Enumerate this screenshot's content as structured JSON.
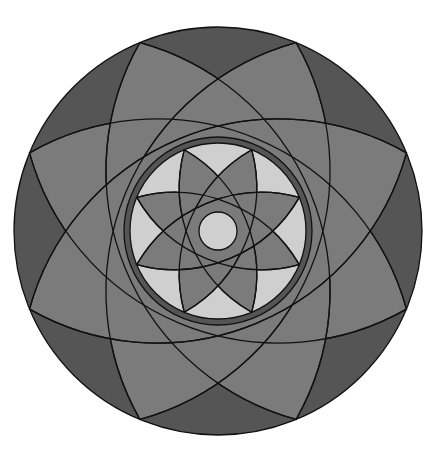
{
  "figure": {
    "type": "geometric-rosette",
    "center": [
      218,
      231
    ],
    "outer_circle_radius": 204,
    "inner_circle_radius": 88,
    "center_circle_radius": 19,
    "outer_petal_count": 8,
    "inner_petal_count": 8,
    "petal_angle_offset_deg": 22.5,
    "colors": {
      "background": "#ffffff",
      "dark": "#555555",
      "mid": "#7b7b7b",
      "light": "#cfcfcf",
      "stroke": "#111111"
    }
  }
}
